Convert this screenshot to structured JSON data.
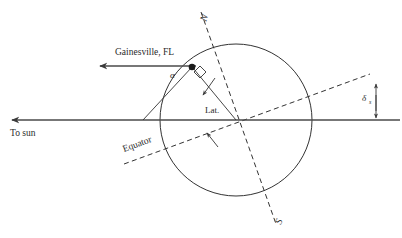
{
  "diagram": {
    "background_color": "#ffffff",
    "line_color": "#333333",
    "labels": {
      "location": "Gainesville, FL",
      "to_sun": "To sun",
      "equator": "Equator",
      "latitude": "Lat.",
      "north_pole": "N",
      "south_pole": "S",
      "alpha": "α",
      "delta": "δ",
      "delta_subscript": "s"
    },
    "elements": {
      "earth_circle": {
        "center_x": 236,
        "center_y": 120,
        "radius": 76
      },
      "sun_ray_line": {
        "from_x": 402,
        "from_y": 120,
        "to_x": 8,
        "to_y": 120,
        "arrow": "left"
      },
      "site_ray_line": {
        "from_x": 353,
        "from_y": 66,
        "to_x": 96,
        "to_y": 66,
        "arrow": "left"
      },
      "polar_axis": {
        "north_x": 201,
        "north_y": 12,
        "south_x": 276,
        "south_y": 224,
        "style": "dashed"
      },
      "equator_plane": {
        "west_x": 124,
        "west_y": 164,
        "east_x": 370,
        "east_y": 74,
        "style": "dashed"
      },
      "gainesville_point": {
        "x": 192,
        "y": 67
      },
      "right_angle_marker": {
        "x": 199,
        "y": 75,
        "size": 9
      }
    },
    "angles": [
      {
        "name": "alpha",
        "symbol": "α",
        "vertex": "gainesville-point",
        "description": "solar altitude angle at site"
      },
      {
        "name": "latitude",
        "symbol": "Lat.",
        "vertex": "earth-center",
        "description": "latitude angle between equator plane and site radius"
      },
      {
        "name": "declination",
        "symbol": "δs",
        "vertex": "right-side",
        "description": "solar declination between equator plane and sun ray"
      }
    ]
  }
}
